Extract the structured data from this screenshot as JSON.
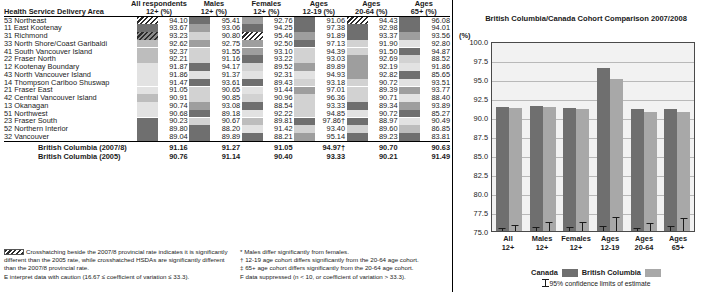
{
  "table": {
    "row_header": "Health Service Delivery Area",
    "columns": [
      {
        "l1": "All respondents",
        "l2": "12+ (%)"
      },
      {
        "l1": "Males",
        "l2": "12+ (%)"
      },
      {
        "l1": "Females",
        "l2": "12+ (%)"
      },
      {
        "l1": "Ages",
        "l2": "12-19 (%)"
      },
      {
        "l1": "Ages",
        "l2": "20-64 (%)"
      },
      {
        "l1": "Ages",
        "l2": "65+ (%)"
      }
    ],
    "rows": [
      {
        "area": "53 Northeast",
        "vals": [
          "94.10",
          "95.41",
          "92.76",
          "91.06",
          "94.43",
          "96.08"
        ],
        "fills": [
          "hatch",
          "dark",
          "mid",
          "dark",
          "hatch",
          "dark"
        ]
      },
      {
        "area": "11 East Kootenay",
        "vals": [
          "93.67",
          "93.06",
          "94.25",
          "97.38",
          "92.98",
          "94.01"
        ],
        "fills": [
          "dark",
          "mid",
          "dark",
          "dark",
          "dark",
          "dark"
        ]
      },
      {
        "area": "31 Richmond",
        "vals": [
          "93.23",
          "90.80",
          "95.46",
          "91.89",
          "93.37",
          "93.56"
        ],
        "fills": [
          "hatchdark",
          "light",
          "hatch",
          "mid",
          "dark",
          "mid"
        ]
      },
      {
        "area": "33 North Shore/Coast Garibaldi",
        "vals": [
          "92.62",
          "92.75",
          "92.50",
          "97.13",
          "91.90",
          "92.80"
        ],
        "fills": [
          "midlight",
          "mid",
          "mid",
          "dark",
          "light",
          "xlight"
        ]
      },
      {
        "area": "41 South Vancouver Island",
        "vals": [
          "92.37",
          "91.55",
          "93.10",
          "94.39",
          "91.50",
          "94.87"
        ],
        "fills": [
          "midlight",
          "light",
          "mid",
          "light",
          "light",
          "dark"
        ]
      },
      {
        "area": "22 Fraser North",
        "vals": [
          "92.21",
          "91.16",
          "93.22",
          "93.03",
          "92.69",
          "88.52"
        ],
        "fills": [
          "midlight",
          "light",
          "dark",
          "light",
          "mid",
          "light"
        ]
      },
      {
        "area": "12 Kootenay Boundary",
        "vals": [
          "91.87",
          "94.17",
          "89.52",
          "89.89",
          "92.19",
          "91.86"
        ],
        "fills": [
          "xlight",
          "dark",
          "light",
          "mid",
          "mid",
          "xlight"
        ]
      },
      {
        "area": "43 North Vancouver Island",
        "vals": [
          "91.86",
          "91.37",
          "92.31",
          "94.93",
          "92.82",
          "85.65"
        ],
        "fills": [
          "xlight",
          "xlight",
          "xlight",
          "xlight",
          "mid",
          "dark"
        ]
      },
      {
        "area": "14 Thompson Cariboo Shuswap",
        "vals": [
          "91.47",
          "93.61",
          "89.43",
          "93.18",
          "90.72",
          "93.51"
        ],
        "fills": [
          "xlight",
          "dark",
          "dark",
          "light",
          "light",
          "xlight"
        ]
      },
      {
        "area": "21 Fraser East",
        "vals": [
          "91.05",
          "90.65",
          "91.44",
          "97.01",
          "89.39",
          "93.77"
        ],
        "fills": [
          "xlight",
          "light",
          "xlight",
          "mid",
          "light",
          "mid"
        ]
      },
      {
        "area": "42 Central Vancouver Island",
        "vals": [
          "90.91",
          "90.85",
          "90.96",
          "96.36",
          "90.71",
          "88.40"
        ],
        "fills": [
          "midlight",
          "light",
          "light",
          "light",
          "light",
          "xlight"
        ]
      },
      {
        "area": "13 Okanagan",
        "vals": [
          "90.74",
          "93.08",
          "88.54",
          "93.33",
          "89.34",
          "93.89"
        ],
        "fills": [
          "xlight",
          "mid",
          "dark",
          "light",
          "dark",
          "mid"
        ]
      },
      {
        "area": "51 Northwest",
        "vals": [
          "90.68",
          "89.18",
          "92.22",
          "94.85",
          "90.72",
          "85.27"
        ],
        "fills": [
          "xlight",
          "dark",
          "xlight",
          "light",
          "xlight",
          "dark"
        ]
      },
      {
        "area": "23 Fraser South",
        "vals": [
          "90.23",
          "90.67",
          "89.81",
          "97.86†",
          "88.97",
          "90.49"
        ],
        "fills": [
          "dark",
          "light",
          "midlight",
          "dark",
          "dark",
          "xlight"
        ]
      },
      {
        "area": "52 Northern Interior",
        "vals": [
          "89.80",
          "88.20",
          "91.42",
          "93.40",
          "89.60",
          "86.85"
        ],
        "fills": [
          "dark",
          "dark",
          "xlight",
          "light",
          "light",
          "midlight"
        ]
      },
      {
        "area": "32 Vancouver",
        "vals": [
          "89.04",
          "89.89",
          "88.21",
          "95.14",
          "89.23",
          "83.81"
        ],
        "fills": [
          "dark",
          "dark",
          "dark",
          "mid",
          "dark",
          "dark"
        ]
      }
    ],
    "totals": [
      {
        "label": "British Columbia (2007/8)",
        "vals": [
          "91.16",
          "91.27",
          "91.05",
          "94.97†",
          "90.70",
          "90.63"
        ]
      },
      {
        "label": "British Columbia (2005)",
        "vals": [
          "90.76",
          "91.14",
          "90.40",
          "93.33",
          "90.21",
          "91.49"
        ]
      }
    ]
  },
  "footnotes": {
    "left": [
      "Crosshatching beside the 2007/8 provincial rate indicates it is significantly different than the 2005 rate, while crosshatched HSDAs are significantly different than the 2007/8 provincial rate.",
      "E interpret data with caution (16.67 ≤ coefficient of variation ≤ 33.3)."
    ],
    "right": [
      "* Males differ significantly from females.",
      "† 12-19 age cohort differs significantly from the 20-64 age cohort.",
      "‡ 65+ age cohort differs significantly from the 20-64 age cohort.",
      "F data suppressed (n < 10, or coefficient of variation > 33.3)."
    ]
  },
  "chart_data": {
    "type": "bar",
    "title": "British Columbia/Canada Cohort Comparison",
    "subtitle": "2007/2008",
    "ylabel": "(%)",
    "xlabel": "",
    "ylim": [
      75.0,
      100.0
    ],
    "yticks": [
      "75.0",
      "77.5",
      "80.0",
      "82.5",
      "85.0",
      "87.5",
      "90.0",
      "92.5",
      "95.0",
      "97.5",
      "100.0"
    ],
    "grid": true,
    "legend_position": "bottom",
    "categories": [
      "All 12+",
      "Males 12+",
      "Females 12+",
      "Ages 12-19",
      "Ages 20-64",
      "Ages 65+"
    ],
    "category_lines": [
      {
        "l1": "All",
        "l2": "12+"
      },
      {
        "l1": "Males",
        "l2": "12+"
      },
      {
        "l1": "Females",
        "l2": "12+"
      },
      {
        "l1": "Ages",
        "l2": "12-19"
      },
      {
        "l1": "Ages",
        "l2": "20-64"
      },
      {
        "l1": "Ages",
        "l2": "65+"
      }
    ],
    "series": [
      {
        "name": "Canada",
        "color": "#6f6f6f",
        "values": [
          91.3,
          91.4,
          91.2,
          96.5,
          91.0,
          91.1
        ],
        "ci_lower": [
          90.9,
          90.9,
          90.6,
          95.8,
          90.6,
          90.4
        ],
        "ci_upper": [
          91.7,
          91.9,
          91.7,
          97.2,
          91.4,
          91.8
        ]
      },
      {
        "name": "British Columbia",
        "color": "#a8a8a8",
        "values": [
          91.16,
          91.27,
          91.05,
          94.97,
          90.7,
          90.63
        ],
        "ci_lower": [
          90.3,
          90.2,
          89.9,
          93.1,
          89.6,
          88.9
        ],
        "ci_upper": [
          92.0,
          92.4,
          92.2,
          96.8,
          91.8,
          92.4
        ]
      }
    ],
    "legend": [
      {
        "label": "Canada",
        "color": "#6f6f6f"
      },
      {
        "label": "British Columbia",
        "color": "#a8a8a8"
      }
    ],
    "ci_note": "95% confidence limits of estimate"
  }
}
